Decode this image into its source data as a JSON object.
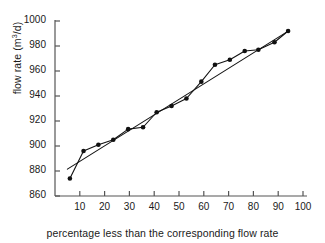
{
  "chart_data": {
    "type": "scatter",
    "title": "",
    "xlabel": "percentage less than the corresponding flow rate",
    "ylabel": "flow rate (m3/d)",
    "ylabel_display": "flow rate (m",
    "ylabel_sup": "3",
    "ylabel_tail": "/d)",
    "xlim": [
      0,
      100
    ],
    "ylim": [
      860,
      1000
    ],
    "xticks": [
      0,
      10,
      20,
      30,
      40,
      50,
      60,
      70,
      80,
      90,
      100
    ],
    "xtick_labels": [
      "",
      "10",
      "20",
      "30",
      "40",
      "50",
      "60",
      "70",
      "80",
      "90",
      "100"
    ],
    "yticks": [
      860,
      880,
      900,
      920,
      940,
      960,
      980,
      1000
    ],
    "ytick_labels": [
      "860",
      "880",
      "900",
      "920",
      "940",
      "960",
      "980",
      "1000"
    ],
    "grid": false,
    "legend": false,
    "marker": "filled-circle",
    "marker_color": "#111111",
    "line_color": "#111111",
    "axis_color": "#555555",
    "background": "#ffffff",
    "x": [
      6.0,
      11.5,
      17.5,
      23.5,
      29.5,
      35.5,
      41.0,
      47.0,
      53.0,
      59.0,
      64.5,
      70.5,
      76.5,
      82.0,
      88.5,
      94.0
    ],
    "values": [
      874,
      896,
      901,
      905,
      913.5,
      915,
      927,
      932,
      938,
      951.5,
      965,
      969,
      976,
      977,
      983,
      992
    ],
    "series": [
      {
        "name": "observed flow rate",
        "x": [
          6.0,
          11.5,
          17.5,
          23.5,
          29.5,
          35.5,
          41.0,
          47.0,
          53.0,
          59.0,
          64.5,
          70.5,
          76.5,
          82.0,
          88.5,
          94.0
        ],
        "values": [
          874,
          896,
          901,
          905,
          913.5,
          915,
          927,
          932,
          938,
          951.5,
          965,
          969,
          976,
          977,
          983,
          992
        ],
        "style": "markers-and-line"
      },
      {
        "name": "fitted straight line",
        "x": [
          5.0,
          94.5
        ],
        "values": [
          881.5,
          992.5
        ],
        "style": "line"
      }
    ]
  },
  "axes": {
    "x_title": "percentage less than the corresponding flow rate",
    "y_title_main": "flow rate (m",
    "y_title_sup": "3",
    "y_title_tail": "/d)"
  }
}
